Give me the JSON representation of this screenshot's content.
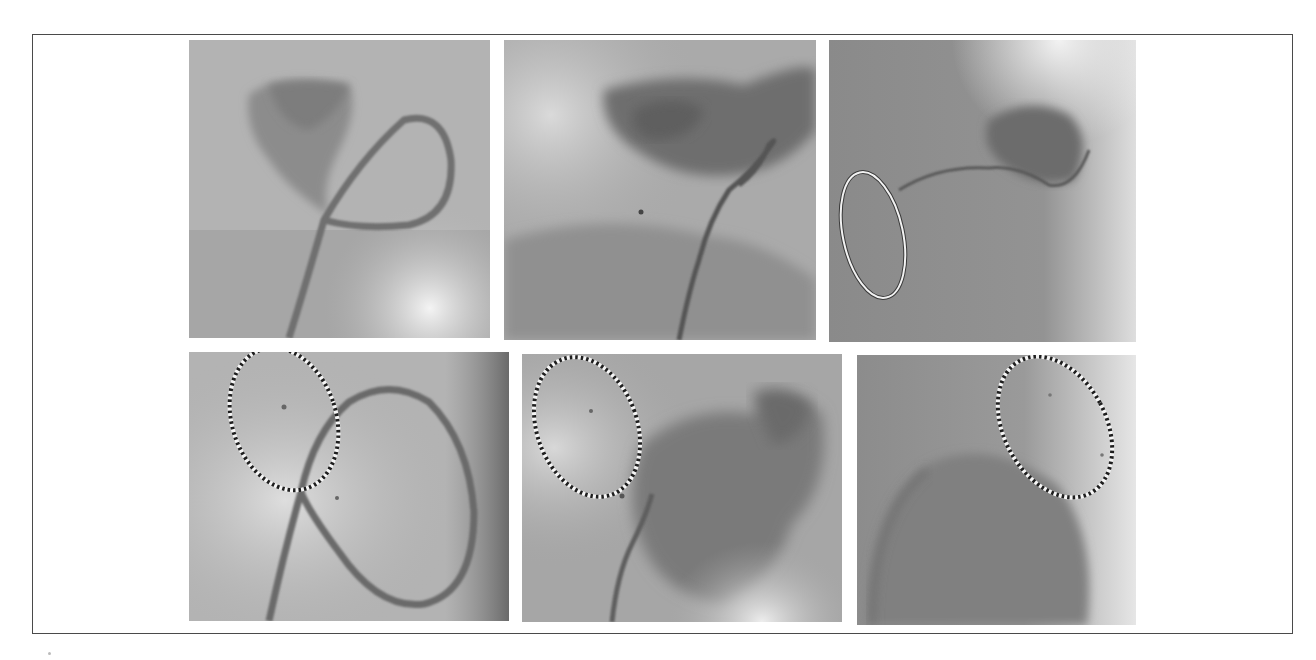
{
  "figure": {
    "frame": {
      "x": 32,
      "y": 34,
      "width": 1261,
      "height": 600,
      "border_color": "#4a4a4a"
    },
    "panels": [
      {
        "id": "top-left",
        "row": 1,
        "col": 1,
        "x": 189,
        "y": 40,
        "width": 301,
        "height": 298,
        "base": "#b2b2b2",
        "annotation": "none"
      },
      {
        "id": "top-middle",
        "row": 1,
        "col": 2,
        "x": 504,
        "y": 40,
        "width": 312,
        "height": 300,
        "base": "#a9a9a9",
        "annotation": "none"
      },
      {
        "id": "top-right",
        "row": 1,
        "col": 3,
        "x": 829,
        "y": 40,
        "width": 307,
        "height": 302,
        "base": "#8f8f8f",
        "annotation": "solid-white-ellipse"
      },
      {
        "id": "bottom-left",
        "row": 2,
        "col": 1,
        "x": 189,
        "y": 352,
        "width": 320,
        "height": 269,
        "base": "#b5b5b5",
        "annotation": "dotted-ellipse"
      },
      {
        "id": "bottom-middle",
        "row": 2,
        "col": 2,
        "x": 522,
        "y": 354,
        "width": 320,
        "height": 268,
        "base": "#a4a4a4",
        "annotation": "dotted-ellipse"
      },
      {
        "id": "bottom-right",
        "row": 2,
        "col": 3,
        "x": 857,
        "y": 355,
        "width": 279,
        "height": 270,
        "base": "#8e8e8e",
        "annotation": "dotted-ellipse"
      }
    ],
    "annotations": [
      {
        "panel": "top-right",
        "type": "solid-ellipse",
        "stroke": "#f2f2f2",
        "cx": 44,
        "cy": 195,
        "rx": 30,
        "ry": 64,
        "rotate": -12
      },
      {
        "panel": "bottom-left",
        "type": "dotted-ellipse",
        "stroke_dark": "#1e1e1e",
        "stroke_light": "#f5f5f5",
        "cx": 95,
        "cy": 67,
        "rx": 52,
        "ry": 73,
        "rotate": -18
      },
      {
        "panel": "bottom-middle",
        "type": "dotted-ellipse",
        "stroke_dark": "#1e1e1e",
        "stroke_light": "#f5f5f5",
        "cx": 65,
        "cy": 73,
        "rx": 50,
        "ry": 72,
        "rotate": -20
      },
      {
        "panel": "bottom-right",
        "type": "dotted-ellipse",
        "stroke_dark": "#1e1e1e",
        "stroke_light": "#f5f5f5",
        "cx": 198,
        "cy": 72,
        "rx": 51,
        "ry": 75,
        "rotate": -28
      }
    ],
    "image_description": "Six grayscale fluoroscopy/angiography frames showing a looped catheter and contrast-filled chamber; lower row frames marked with dotted ellipses, upper-right frame marked with solid white ellipse."
  }
}
